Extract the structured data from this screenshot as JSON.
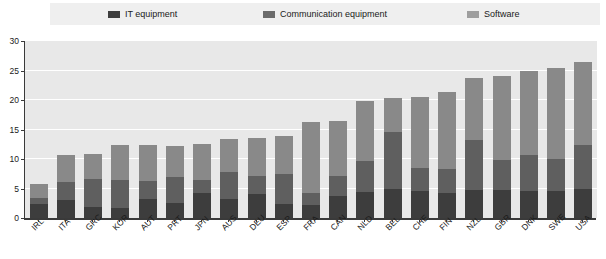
{
  "legend": {
    "items": [
      {
        "label": "IT equipment",
        "color": "#3d3d3d",
        "key": "it"
      },
      {
        "label": "Communication equipment",
        "color": "#6b6b6b",
        "key": "comm"
      },
      {
        "label": "Software",
        "color": "#9e9e9e",
        "key": "software"
      }
    ]
  },
  "colors": {
    "it": "#3d3d3d",
    "comm": "#5f5f5f",
    "software": "#898989",
    "plot_bg": "#e8e8e8",
    "legend_bg": "#efefef",
    "grid": "#ffffff",
    "axis": "#3a3a3a"
  },
  "chart_data": {
    "type": "bar",
    "stacked": true,
    "title": "",
    "xlabel": "",
    "ylabel": "",
    "ylim": [
      0,
      30
    ],
    "yticks": [
      0,
      5,
      10,
      15,
      20,
      25,
      30
    ],
    "grid": true,
    "legend_position": "top",
    "categories": [
      "IRL",
      "ITA",
      "GRC",
      "KOR",
      "AUT",
      "PRT",
      "JPN",
      "AUS",
      "DEU",
      "ESP",
      "FRA",
      "CAN",
      "NLD",
      "BEL",
      "CHE",
      "FIN",
      "NZL",
      "GBR",
      "DNK",
      "SWE",
      "USA"
    ],
    "series": [
      {
        "name": "IT equipment",
        "values": [
          2.4,
          3.1,
          1.9,
          1.7,
          3.3,
          2.6,
          4.3,
          3.2,
          4.0,
          2.4,
          2.2,
          3.8,
          4.4,
          4.9,
          4.6,
          4.2,
          4.7,
          4.7,
          4.6,
          4.6,
          5.0
        ]
      },
      {
        "name": "Communication equipment",
        "values": [
          1.0,
          3.0,
          4.7,
          4.8,
          3.0,
          4.3,
          2.1,
          4.6,
          3.1,
          5.1,
          2.1,
          3.4,
          5.3,
          9.7,
          3.8,
          4.1,
          8.6,
          5.2,
          6.0,
          5.4,
          7.3
        ]
      },
      {
        "name": "Software",
        "values": [
          2.3,
          4.5,
          4.3,
          5.8,
          6.0,
          5.3,
          6.2,
          5.6,
          6.5,
          6.4,
          11.9,
          9.2,
          10.1,
          5.8,
          12.1,
          13.1,
          10.5,
          14.1,
          14.3,
          15.4,
          14.2
        ]
      }
    ],
    "totals": [
      5.7,
      10.6,
      10.9,
      12.3,
      12.3,
      12.2,
      12.6,
      13.4,
      13.6,
      13.9,
      16.2,
      16.4,
      19.8,
      20.4,
      20.5,
      21.4,
      23.8,
      24.0,
      24.9,
      25.4,
      26.5
    ]
  }
}
